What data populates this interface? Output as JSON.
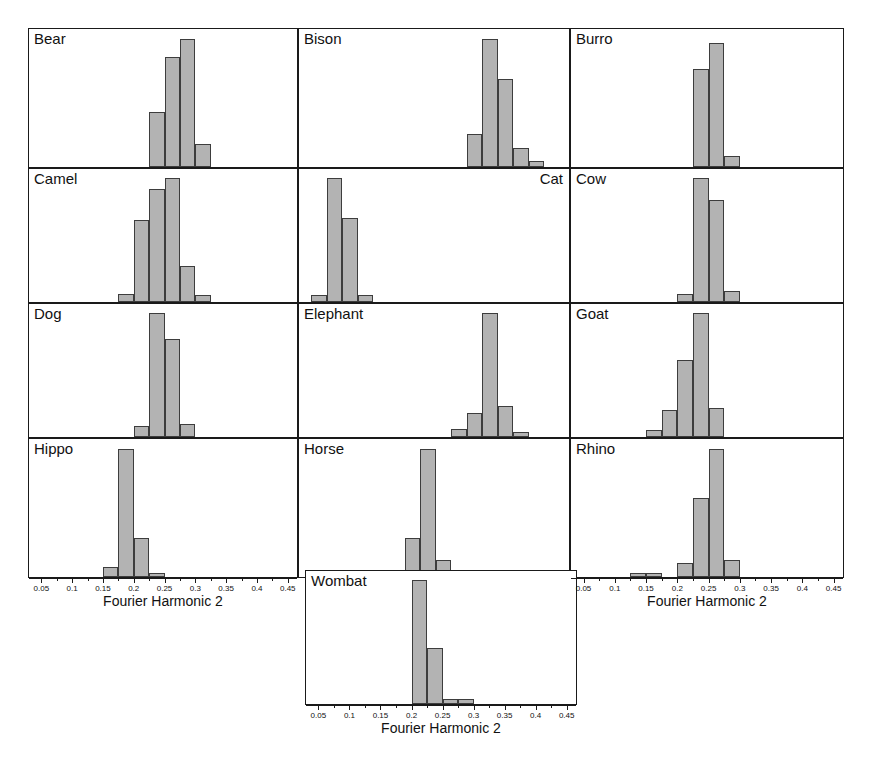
{
  "figure": {
    "axis_title": "Fourier Harmonic 2",
    "bar_fill_color": "#b3b3b3",
    "bar_edge_color": "#3d3d3d",
    "panel_border_color": "#1a1a1a",
    "background_color": "#ffffff"
  },
  "axis": {
    "min": 0.03,
    "max": 0.465,
    "tick_labels": [
      "0.05",
      "0.1",
      "0.15",
      "0.2",
      "0.25",
      "0.3",
      "0.35",
      "0.4",
      "0.45"
    ],
    "tick_values": [
      0.05,
      0.1,
      0.15,
      0.2,
      0.25,
      0.3,
      0.35,
      0.4,
      0.45
    ],
    "minor_tick_values": [
      0.075,
      0.125,
      0.175,
      0.225,
      0.275,
      0.325,
      0.375,
      0.425
    ]
  },
  "panels": [
    {
      "label": "Bear",
      "label_align": "left"
    },
    {
      "label": "Bison",
      "label_align": "left"
    },
    {
      "label": "Burro",
      "label_align": "left"
    },
    {
      "label": "Camel",
      "label_align": "left"
    },
    {
      "label": "Cat",
      "label_align": "right"
    },
    {
      "label": "Cow",
      "label_align": "left"
    },
    {
      "label": "Dog",
      "label_align": "left"
    },
    {
      "label": "Elephant",
      "label_align": "left"
    },
    {
      "label": "Goat",
      "label_align": "left"
    },
    {
      "label": "Hippo",
      "label_align": "left"
    },
    {
      "label": "Horse",
      "label_align": "left"
    },
    {
      "label": "Rhino",
      "label_align": "left"
    },
    {
      "label": "Wombat",
      "label_align": "left"
    }
  ],
  "chart_data": {
    "type": "bar",
    "title": "",
    "subtitle": "",
    "xlabel": "Fourier Harmonic 2",
    "ylabel": "",
    "xlim": [
      0.03,
      0.465
    ],
    "ylim": [
      0,
      1.0
    ],
    "grid": false,
    "legend": "none",
    "layout": "trellis 3 columns x 4 rows plus centered bottom panel",
    "bin_width": 0.025,
    "note": "Per-panel histograms of Fourier Harmonic 2 by animal; bar heights are relative frequencies normalized to the tallest bar within each panel.",
    "panels": [
      {
        "name": "Bear",
        "bins": [
          0.225,
          0.25,
          0.275,
          0.3
        ],
        "values": [
          0.4,
          0.8,
          0.93,
          0.17
        ]
      },
      {
        "name": "Bison",
        "bins": [
          0.3,
          0.325,
          0.35,
          0.375,
          0.4
        ],
        "values": [
          0.24,
          0.93,
          0.64,
          0.14,
          0.04
        ]
      },
      {
        "name": "Burro",
        "bins": [
          0.225,
          0.25,
          0.275
        ],
        "values": [
          0.71,
          0.9,
          0.08
        ]
      },
      {
        "name": "Camel",
        "bins": [
          0.175,
          0.2,
          0.225,
          0.25,
          0.275,
          0.3
        ],
        "values": [
          0.06,
          0.62,
          0.85,
          0.93,
          0.27,
          0.05
        ]
      },
      {
        "name": "Cat",
        "bins": [
          0.05,
          0.075,
          0.1,
          0.125
        ],
        "values": [
          0.05,
          0.93,
          0.63,
          0.05
        ]
      },
      {
        "name": "Cow",
        "bins": [
          0.2,
          0.225,
          0.25,
          0.275
        ],
        "values": [
          0.06,
          0.93,
          0.77,
          0.08
        ]
      },
      {
        "name": "Dog",
        "bins": [
          0.2,
          0.225,
          0.25,
          0.275
        ],
        "values": [
          0.08,
          0.93,
          0.74,
          0.1
        ]
      },
      {
        "name": "Elephant",
        "bins": [
          0.275,
          0.3,
          0.325,
          0.35,
          0.375
        ],
        "values": [
          0.06,
          0.18,
          0.93,
          0.23,
          0.04
        ]
      },
      {
        "name": "Goat",
        "bins": [
          0.15,
          0.175,
          0.2,
          0.225,
          0.25
        ],
        "values": [
          0.05,
          0.2,
          0.58,
          0.93,
          0.22
        ]
      },
      {
        "name": "Hippo",
        "bins": [
          0.15,
          0.175,
          0.2,
          0.225
        ],
        "values": [
          0.07,
          0.93,
          0.28,
          0.03
        ]
      },
      {
        "name": "Horse",
        "bins": [
          0.2,
          0.225,
          0.25
        ],
        "values": [
          0.28,
          0.93,
          0.12
        ]
      },
      {
        "name": "Rhino",
        "bins": [
          0.125,
          0.15,
          0.2,
          0.225,
          0.25,
          0.275
        ],
        "values": [
          0.03,
          0.03,
          0.1,
          0.57,
          0.93,
          0.12
        ]
      },
      {
        "name": "Wombat",
        "bins": [
          0.2,
          0.225,
          0.25,
          0.275
        ],
        "values": [
          0.93,
          0.42,
          0.04,
          0.04
        ]
      }
    ]
  }
}
